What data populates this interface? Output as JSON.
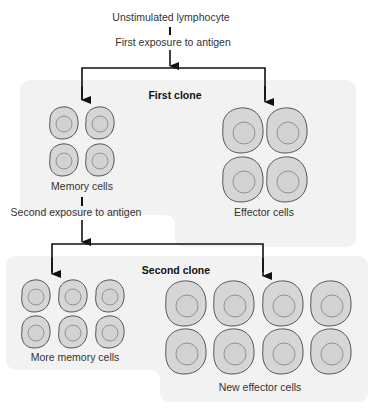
{
  "diagram": {
    "title_top": "Unstimulated lymphocyte",
    "first_exposure": "First exposure to antigen",
    "first_clone": {
      "title": "First clone",
      "memory_label": "Memory cells",
      "memory_count": 4,
      "effector_label": "Effector cells",
      "effector_count": 4
    },
    "second_exposure": "Second exposure to antigen",
    "second_clone": {
      "title": "Second clone",
      "memory_label": "More memory cells",
      "memory_count": 6,
      "effector_label": "New effector cells",
      "effector_count": 8
    },
    "colors": {
      "panel": "#f2f2f2",
      "cell_fill": "#d6d6d6",
      "cell_stroke": "#555555",
      "nucleus_stroke": "#888888",
      "arrow": "#111111"
    }
  }
}
